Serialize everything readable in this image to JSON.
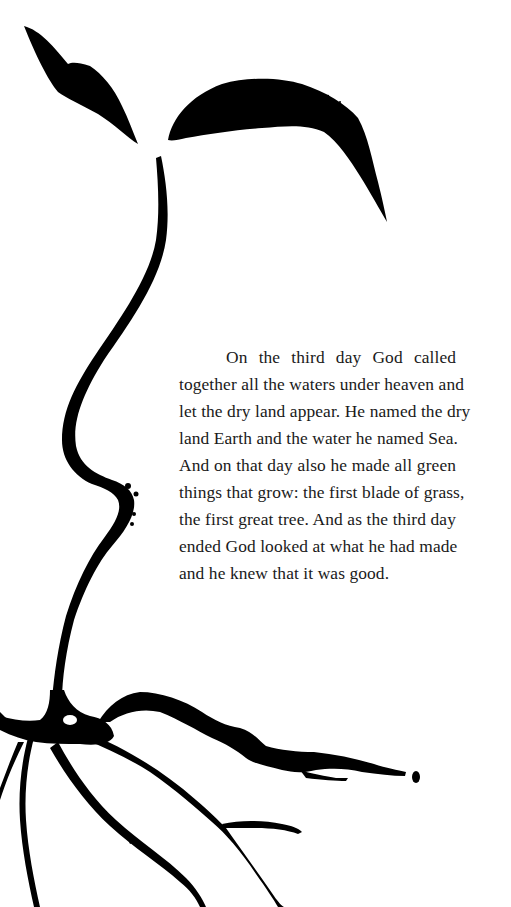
{
  "page": {
    "background_color": "#ffffff",
    "ink_color": "#000000",
    "text_color": "#1a1a1a"
  },
  "illustration": {
    "subject": "seedling with two leaves, long curving stem and spreading roots",
    "icon": "seedling-icon"
  },
  "passage": {
    "lines": [
      "On the third day God called",
      "together all the waters under heaven and",
      "let the dry land appear. He named the dry",
      "land Earth and the water he named Sea.",
      "And on that day also he made all green",
      "things that grow: the first blade of grass,",
      "the first great tree. And as the third day",
      "ended God looked at what he had made",
      "and he knew that it was good."
    ]
  }
}
